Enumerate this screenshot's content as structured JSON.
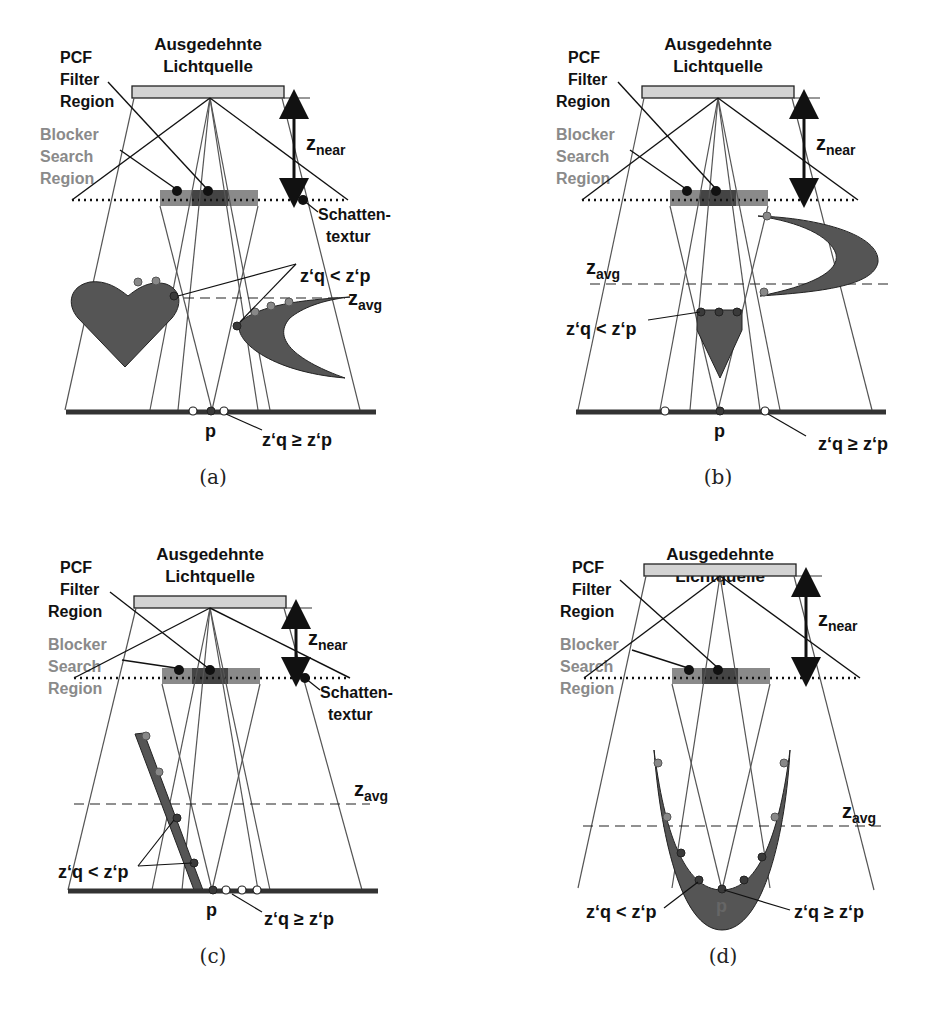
{
  "figure": {
    "labels": {
      "light_title_line1": "Ausgedehnte",
      "light_title_line2": "Lichtquelle",
      "pcf_line1": "PCF",
      "pcf_line2": "Filter",
      "pcf_line3": "Region",
      "blocker_line1": "Blocker",
      "blocker_line2": "Search",
      "blocker_line3": "Region",
      "z_main": "z",
      "near_sub": "near",
      "avg_sub": "avg",
      "shadow_tex_line1": "Schatten-",
      "shadow_tex_line2": "textur",
      "zq_lt_zp": "z‘q < z‘p",
      "zq_ge_zp": "z‘q ≥ z‘p",
      "point_p": "p"
    },
    "panels": [
      {
        "id": "a",
        "caption": "(a)",
        "occluders": [
          "heart",
          "crescent"
        ],
        "has_shadow_texture_label": true
      },
      {
        "id": "b",
        "caption": "(b)",
        "occluders": [
          "crescent-above-zavg",
          "cone"
        ],
        "has_shadow_texture_label": false
      },
      {
        "id": "c",
        "caption": "(c)",
        "occluders": [
          "slanted-plank"
        ],
        "has_shadow_texture_label": true
      },
      {
        "id": "d",
        "caption": "(d)",
        "occluders": [
          "u-shaped-bowl"
        ],
        "has_shadow_texture_label": false
      }
    ],
    "colors": {
      "light_source": "#d3d3d3",
      "occluder": "#555555",
      "blocker_region": "#8a8a8a",
      "pcf_region": "#444444",
      "gray_label": "#8a8a8a"
    }
  }
}
